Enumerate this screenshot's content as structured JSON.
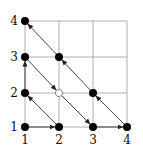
{
  "diagram": {
    "type": "grid-enumeration",
    "x_ticks": [
      "1",
      "2",
      "3",
      "4"
    ],
    "y_ticks": [
      "1",
      "2",
      "3",
      "4"
    ],
    "grid_color": "#999999",
    "point_color": "#000000",
    "arrow_color": "#333333",
    "points": [
      {
        "x": 1,
        "y": 1,
        "style": "filled"
      },
      {
        "x": 2,
        "y": 1,
        "style": "filled"
      },
      {
        "x": 1,
        "y": 2,
        "style": "filled"
      },
      {
        "x": 1,
        "y": 3,
        "style": "filled"
      },
      {
        "x": 2,
        "y": 2,
        "style": "hollow"
      },
      {
        "x": 3,
        "y": 1,
        "style": "filled"
      },
      {
        "x": 4,
        "y": 1,
        "style": "filled"
      },
      {
        "x": 3,
        "y": 2,
        "style": "filled"
      },
      {
        "x": 2,
        "y": 3,
        "style": "filled"
      },
      {
        "x": 1,
        "y": 4,
        "style": "filled"
      }
    ],
    "path": [
      [
        1,
        1
      ],
      [
        2,
        1
      ],
      [
        1,
        2
      ],
      [
        1,
        3
      ],
      [
        2,
        2
      ],
      [
        3,
        1
      ],
      [
        4,
        1
      ],
      [
        3,
        2
      ],
      [
        2,
        3
      ],
      [
        1,
        4
      ]
    ]
  }
}
